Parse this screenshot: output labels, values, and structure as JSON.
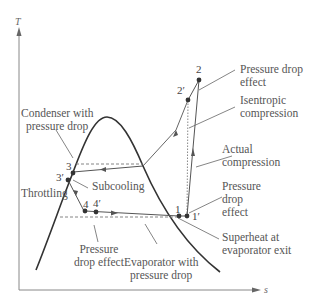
{
  "diagram": {
    "type": "T-s diagram, vapor compression refrigeration cycle with pressure drops",
    "axes": {
      "y_label": "T",
      "x_label": "s"
    },
    "points": {
      "p2": "2",
      "p2p": "2′",
      "p3": "3",
      "p3p": "3′",
      "p4": "4",
      "p4p": "4′",
      "p1": "1",
      "p1p": "1′"
    },
    "annotations": {
      "pressure_drop_effect_top": [
        "Pressure drop",
        "effect"
      ],
      "isentropic_compression": [
        "Isentropic",
        "compression"
      ],
      "actual_compression": [
        "Actual",
        "compression"
      ],
      "pressure_drop_effect_right": [
        "Pressure",
        "drop",
        "effect"
      ],
      "superheat": [
        "Superheat at",
        "evaporator exit"
      ],
      "condenser": [
        "Condenser with",
        "pressure drop"
      ],
      "subcooling": "Subcooling",
      "throttling": "Throttling",
      "pressure_drop_effect_bottom": [
        "Pressure",
        "drop effect"
      ],
      "evaporator": [
        "Evaporator with",
        "pressure drop"
      ]
    },
    "colors": {
      "line": "#555555",
      "dome": "#333333",
      "text": "#555555",
      "dashed": "#777777"
    }
  }
}
